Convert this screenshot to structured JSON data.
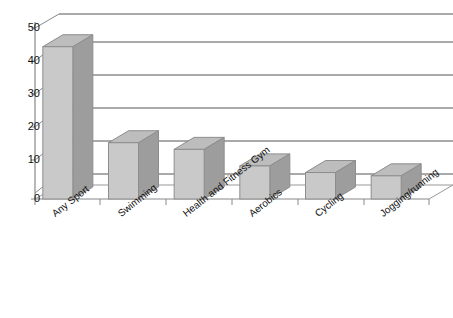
{
  "chart_data": {
    "type": "bar",
    "title": "",
    "subtitle": "",
    "xlabel": "",
    "ylabel": "",
    "categories": [
      "Any Sport",
      "Swimming",
      "Health and Fitness Gym",
      "Aerobics",
      "Cycling",
      "Jogging/running"
    ],
    "values": [
      46,
      17,
      15,
      10,
      8,
      7
    ],
    "ylim": [
      0,
      50
    ],
    "yticks": [
      0,
      10,
      20,
      30,
      40,
      50
    ],
    "ytick_labels": [
      "0",
      "10",
      "20",
      "30",
      "40",
      "50"
    ],
    "gridlines": [
      5,
      15,
      25,
      35,
      45,
      55
    ],
    "grid": true,
    "legend": null,
    "legend_position": "none",
    "style": "3d-column",
    "colors": {
      "bar_front": "#c9c9c9",
      "bar_side": "#9d9d9d",
      "bar_top": "#bdbdbd",
      "bar_outline": "#8d8d8d",
      "gridline": "#555555",
      "axis": "#777777",
      "text": "#111111",
      "background": "#ffffff"
    }
  },
  "axis": {
    "y_ticks": [
      {
        "label": "50",
        "value": 50
      },
      {
        "label": "40",
        "value": 40
      },
      {
        "label": "30",
        "value": 30
      },
      {
        "label": "20",
        "value": 20
      },
      {
        "label": "10",
        "value": 10
      },
      {
        "label": "0",
        "value": 0
      }
    ]
  }
}
